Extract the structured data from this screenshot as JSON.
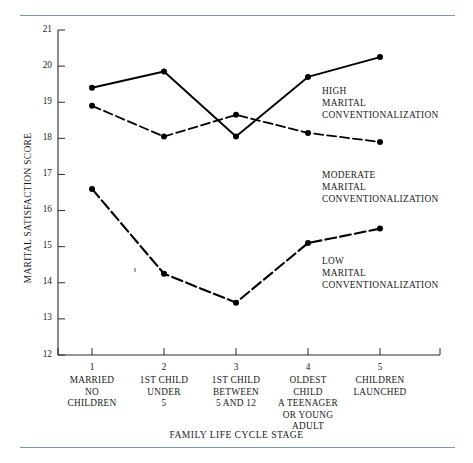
{
  "figure": {
    "top_rule_color": "#7b96b0",
    "bottom_rule_color": "#7b96b0"
  },
  "chart_data": {
    "type": "line",
    "title": "",
    "xlabel": "FAMILY LIFE CYCLE STAGE",
    "ylabel": "MARITAL SATISFACTION SCORE",
    "ylim": [
      12,
      21
    ],
    "yticks": [
      12,
      13,
      14,
      15,
      16,
      17,
      18,
      19,
      20,
      21
    ],
    "ytick_labels": [
      "12",
      "13",
      "14",
      "15",
      "16",
      "17",
      "18",
      "19",
      "20",
      "21"
    ],
    "x": [
      1,
      2,
      3,
      4,
      5
    ],
    "xtick_labels": [
      "1",
      "2",
      "3",
      "4",
      "5"
    ],
    "categories": [
      "MARRIED\nNO\nCHILDREN",
      "1ST CHILD\nUNDER\n5",
      "1ST CHILD\nBETWEEN\n5 AND 12",
      "OLDEST\nCHILD\nA TEENAGER\nOR YOUNG\nADULT",
      "CHILDREN\nLAUNCHED"
    ],
    "category_lines": [
      [
        "MARRIED",
        "NO",
        "CHILDREN"
      ],
      [
        "1ST CHILD",
        "UNDER",
        "5"
      ],
      [
        "1ST CHILD",
        "BETWEEN",
        "5 AND 12"
      ],
      [
        "OLDEST",
        "CHILD",
        "A TEENAGER",
        "OR YOUNG",
        "ADULT"
      ],
      [
        "CHILDREN",
        "LAUNCHED"
      ]
    ],
    "grid": false,
    "legend_position": "inline-annotations",
    "series": [
      {
        "name": "HIGH MARITAL CONVENTIONALIZATION",
        "label_lines": [
          "HIGH",
          "MARITAL",
          "CONVENTIONALIZATION"
        ],
        "style": "solid",
        "marker": "filled-circle",
        "color": "#000000",
        "values": [
          19.4,
          19.85,
          18.05,
          19.7,
          20.25
        ]
      },
      {
        "name": "MODERATE MARITAL CONVENTIONALIZATION",
        "label_lines": [
          "MODERATE",
          "MARITAL",
          "CONVENTIONALIZATION"
        ],
        "style": "dashed",
        "marker": "filled-circle",
        "color": "#000000",
        "values": [
          18.9,
          18.05,
          18.65,
          18.15,
          17.9
        ]
      },
      {
        "name": "LOW MARITAL CONVENTIONALIZATION",
        "label_lines": [
          "LOW",
          "MARITAL",
          "CONVENTIONALIZATION"
        ],
        "style": "dashed-thick",
        "marker": "filled-circle",
        "color": "#000000",
        "values": [
          16.6,
          14.25,
          13.45,
          15.1,
          15.5
        ]
      }
    ]
  }
}
